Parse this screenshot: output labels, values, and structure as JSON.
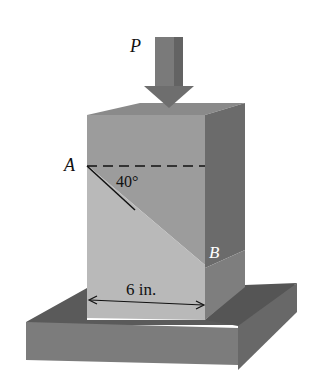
{
  "figure": {
    "load_label": "P",
    "point_a_label": "A",
    "point_b_label": "B",
    "angle_label": "40°",
    "width_label": "6 in."
  },
  "colors": {
    "background": "#ffffff",
    "arrow_front": "#7a7a7a",
    "arrow_side": "#5e5e5e",
    "block_top": "#8a8a8a",
    "block_front_upper": "#9c9c9c",
    "block_front_lower": "#b9b9b9",
    "block_side": "#6b6b6b",
    "block_side_lower": "#7e7e7e",
    "base_top": "#5a5a5a",
    "base_front": "#7c7c7c",
    "base_side": "#686868",
    "lines": "#111111"
  }
}
